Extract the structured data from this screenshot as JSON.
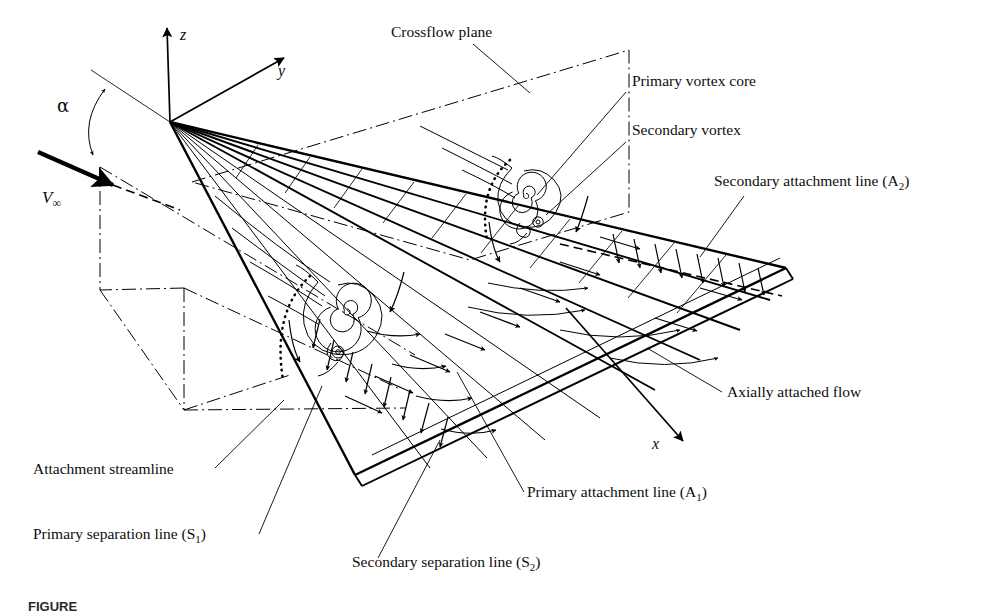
{
  "figure": {
    "caption_number": "FIGURE",
    "background_color": "#ffffff",
    "line_color": "#000000"
  },
  "axes": {
    "x_label": "x",
    "y_label": "y",
    "z_label": "z",
    "angle_label": "α",
    "freestream_label": "V",
    "freestream_sub": "∞"
  },
  "annotations": [
    {
      "id": "crossflow-plane",
      "text": "Crossflow plane",
      "x": 391,
      "y": 37
    },
    {
      "id": "primary-vortex-core",
      "text": "Primary vortex core",
      "x": 632,
      "y": 86
    },
    {
      "id": "secondary-vortex",
      "text": "Secondary vortex",
      "x": 632,
      "y": 135
    },
    {
      "id": "secondary-attachment-line",
      "text": "Secondary attachment line (A",
      "sub": "2",
      "tail": ")",
      "x": 714,
      "y": 186
    },
    {
      "id": "axially-attached-flow",
      "text": "Axially attached flow",
      "x": 727,
      "y": 397
    },
    {
      "id": "primary-attachment-line",
      "text": "Primary attachment line (A",
      "sub": "1",
      "tail": ")",
      "x": 527,
      "y": 497
    },
    {
      "id": "attachment-streamline",
      "text": "Attachment streamline",
      "x": 33,
      "y": 474
    },
    {
      "id": "primary-separation-line",
      "text": "Primary separation line (S",
      "sub": "1",
      "tail": ")",
      "x": 33,
      "y": 539
    },
    {
      "id": "secondary-separation-line",
      "text": "Secondary separation line (S",
      "sub": "2",
      "tail": ")",
      "x": 352,
      "y": 567
    }
  ]
}
